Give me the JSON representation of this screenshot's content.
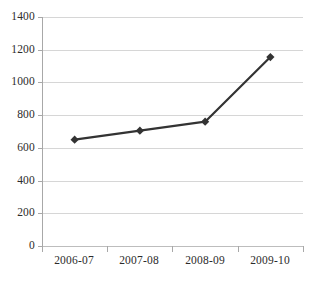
{
  "chart_data": {
    "type": "line",
    "title": "",
    "xlabel": "",
    "ylabel": "",
    "categories": [
      "2006-07",
      "2007-08",
      "2008-09",
      "2009-10"
    ],
    "values": [
      650,
      705,
      760,
      1155
    ],
    "series": [
      {
        "name": "Series 1",
        "values": [
          650,
          705,
          760,
          1155
        ],
        "line_color": "#333333",
        "marker": "diamond",
        "marker_color": "#333333"
      }
    ],
    "ylim": [
      0,
      1400
    ],
    "y_ticks": [
      0,
      200,
      400,
      600,
      800,
      1000,
      1200,
      1400
    ],
    "y_tick_labels": [
      "0",
      "200",
      "400",
      "600",
      "800",
      "1000",
      "1200",
      "1400"
    ],
    "x_tick_labels": [
      "2006-07",
      "2007-08",
      "2008-09",
      "2009-10"
    ],
    "grid": true,
    "grid_axis": "y",
    "legend": false,
    "legend_position": "none",
    "colors": {
      "background": "#ffffff",
      "gridline": "#d6d6d6",
      "axis": "#a8a8a8",
      "text": "#2b2b2b",
      "line": "#333333"
    }
  }
}
